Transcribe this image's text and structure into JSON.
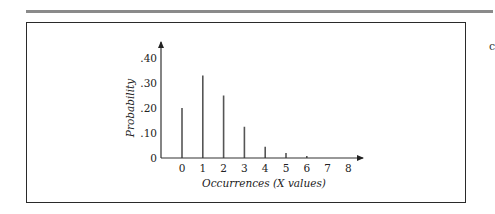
{
  "chart_data": {
    "type": "bar",
    "subtype": "stem",
    "title": "",
    "xlabel": "Occurrences (X values)",
    "ylabel": "Probability",
    "categories": [
      "0",
      "1",
      "2",
      "3",
      "4",
      "5",
      "6",
      "7",
      "8"
    ],
    "values": [
      0.2,
      0.33,
      0.25,
      0.125,
      0.045,
      0.02,
      0.008,
      0,
      0
    ],
    "ylim": [
      0,
      0.45
    ],
    "yticks": [
      0,
      0.1,
      0.2,
      0.3,
      0.4
    ],
    "ytick_labels": [
      "0",
      ".10",
      ".20",
      ".30",
      ".40"
    ],
    "xtick_labels": [
      "0",
      "1",
      "2",
      "3",
      "4",
      "5",
      "6",
      "7",
      "8"
    ],
    "grid": false,
    "legend": null
  },
  "page": {
    "side_glyph": "c"
  }
}
